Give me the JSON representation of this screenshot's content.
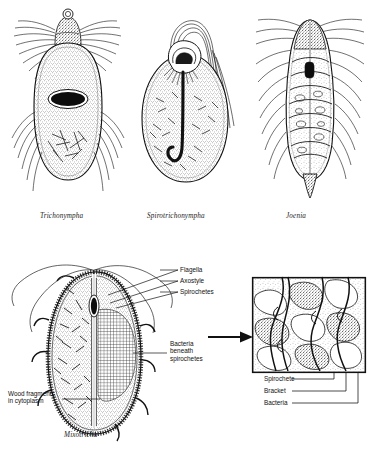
{
  "figure": {
    "kind": "scientific-illustration",
    "background_color": "#ffffff",
    "ink_color": "#111111"
  },
  "top_row": {
    "organisms": [
      {
        "id": "trichonympha",
        "caption": "Trichonympha",
        "shape": "elongated ovoid with apical cap",
        "features": [
          "apical flagellar cap",
          "dense lateral flagella",
          "dark oval nucleus",
          "stippled cytoplasm",
          "wood fragments"
        ]
      },
      {
        "id": "spirotrichonympha",
        "caption": "Spirotrichonympha",
        "shape": "teardrop / pear",
        "features": [
          "spiral apical flagellar band",
          "long hooked axostyle",
          "swept flagellar tuft",
          "stippled cytoplasm"
        ]
      },
      {
        "id": "joenia",
        "caption": "Joenia",
        "shape": "elongated with pointed tail",
        "features": [
          "banded segmented interior",
          "dark nucleus",
          "bilateral flagellar fringe",
          "pointed posterior tip"
        ]
      }
    ]
  },
  "main_figure": {
    "caption": "Mixotricha",
    "callouts_right": [
      {
        "label": "Flagella"
      },
      {
        "label": "Axostyle"
      },
      {
        "label": "Spirochetes"
      }
    ],
    "callout_bacteria": {
      "lines": [
        "Bacteria",
        "beneath",
        "spirochetes"
      ]
    },
    "callout_left": {
      "lines": [
        "Wood fragments",
        "in cytoplasm"
      ]
    },
    "features": [
      "spirochete fringe",
      "central axostyle",
      "nucleus",
      "bacterial grid zone",
      "wood fragments",
      "four long flagella"
    ]
  },
  "inset": {
    "kind": "magnified-detail",
    "arrow": "arrow-right",
    "labels": [
      {
        "label": "Spirochete"
      },
      {
        "label": "Bracket"
      },
      {
        "label": "Bacteria"
      }
    ]
  }
}
